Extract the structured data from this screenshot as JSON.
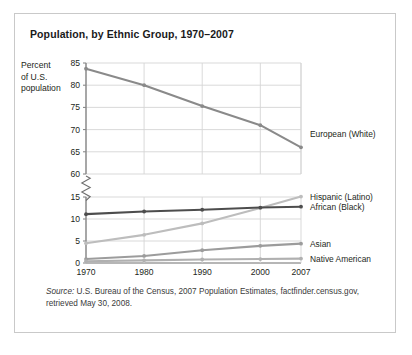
{
  "card": {
    "title": "Population, by Ethnic Group, 1970–2007",
    "source_label": "Source:",
    "source_text": " U.S. Bureau of the Census, 2007 Population Estimates, factfinder.census.gov, retrieved May 30, 2008."
  },
  "chart_data": {
    "type": "line",
    "title": "Population, by Ethnic Group, 1970–2007",
    "xlabel": "Year",
    "ylabel": "Percent of U.S. population",
    "x": [
      1970,
      1980,
      1990,
      2000,
      2007
    ],
    "xtick_labels": [
      "1970",
      "1980",
      "1990",
      "2000",
      "2007"
    ],
    "axis_break": true,
    "axis_break_note": "y-axis broken between 15 and 60",
    "ylim_upper": [
      60,
      85
    ],
    "ylim_lower": [
      0,
      15
    ],
    "ytick_labels_upper": [
      "85",
      "80",
      "75",
      "70",
      "65",
      "60"
    ],
    "ytick_labels_lower": [
      "15",
      "10",
      "5",
      "0"
    ],
    "yticks_upper": [
      85,
      80,
      75,
      70,
      65,
      60
    ],
    "yticks_lower": [
      15,
      10,
      5,
      0
    ],
    "grid": true,
    "legend_position": "right-inline",
    "series": [
      {
        "name": "European (White)",
        "color": "#8a8a8a",
        "values": [
          83.7,
          80.0,
          75.3,
          71.0,
          66.0
        ]
      },
      {
        "name": "Hispanic (Latino)",
        "color": "#bdbdbd",
        "values": [
          4.5,
          6.4,
          9.0,
          12.5,
          15.1
        ]
      },
      {
        "name": "African (Black)",
        "color": "#4d4d4d",
        "values": [
          11.1,
          11.7,
          12.1,
          12.6,
          12.8
        ]
      },
      {
        "name": "Asian",
        "color": "#9c9c9c",
        "values": [
          0.9,
          1.6,
          2.9,
          3.9,
          4.4
        ]
      },
      {
        "name": "Native American",
        "color": "#b0b0b0",
        "values": [
          0.4,
          0.6,
          0.8,
          0.9,
          1.0
        ]
      }
    ]
  }
}
